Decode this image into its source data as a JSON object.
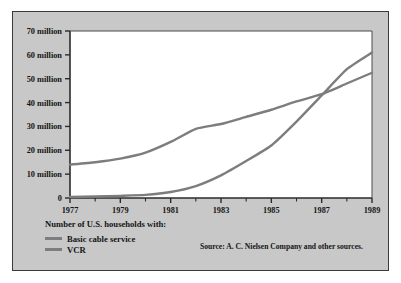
{
  "figure": {
    "top_partial_text": "",
    "frame_bg": "#c8c8c8",
    "plot_bg": "#ffffff",
    "frame_border": "#3a3a3a"
  },
  "legend": {
    "title": "Number of U.S. households with:",
    "items": [
      {
        "label": "Basic cable service",
        "color": "#7d7d7d"
      },
      {
        "label": "VCR",
        "color": "#7d7d7d"
      }
    ]
  },
  "source": {
    "text": "Source: A. C. Nielsen Company and other sources."
  },
  "chart_data": {
    "type": "line",
    "title": "",
    "xlabel": "",
    "ylabel": "",
    "grid": false,
    "legend_position": "below-left",
    "xlim": [
      1977,
      1989
    ],
    "ylim": [
      0,
      70000000
    ],
    "x_tick_labels": [
      "1977",
      "1979",
      "1981",
      "1983",
      "1985",
      "1987",
      "1989"
    ],
    "x_major_ticks": [
      1977,
      1979,
      1981,
      1983,
      1985,
      1987,
      1989
    ],
    "x_minor_ticks": [
      1978,
      1980,
      1982,
      1984,
      1986,
      1988
    ],
    "y_tick_labels": [
      "0",
      "10 million",
      "20 million",
      "30 million",
      "40 million",
      "50 million",
      "60 million",
      "70 million"
    ],
    "y_ticks": [
      0,
      10000000,
      20000000,
      30000000,
      40000000,
      50000000,
      60000000,
      70000000
    ],
    "x": [
      1977,
      1978,
      1979,
      1980,
      1981,
      1982,
      1983,
      1984,
      1985,
      1986,
      1987,
      1988,
      1989
    ],
    "series": [
      {
        "name": "Basic cable service",
        "color": "#7d7d7d",
        "values": [
          14000000,
          15000000,
          16500000,
          19000000,
          23500000,
          29000000,
          31000000,
          34000000,
          37000000,
          40500000,
          43500000,
          48000000,
          52500000
        ]
      },
      {
        "name": "VCR",
        "color": "#7d7d7d",
        "values": [
          400000,
          600000,
          900000,
          1300000,
          2500000,
          5000000,
          9500000,
          15500000,
          22000000,
          32000000,
          43000000,
          54000000,
          61000000
        ]
      }
    ],
    "annotations": [
      {
        "text": "lines cross",
        "x": 1986.8,
        "y": 43000000
      }
    ]
  }
}
